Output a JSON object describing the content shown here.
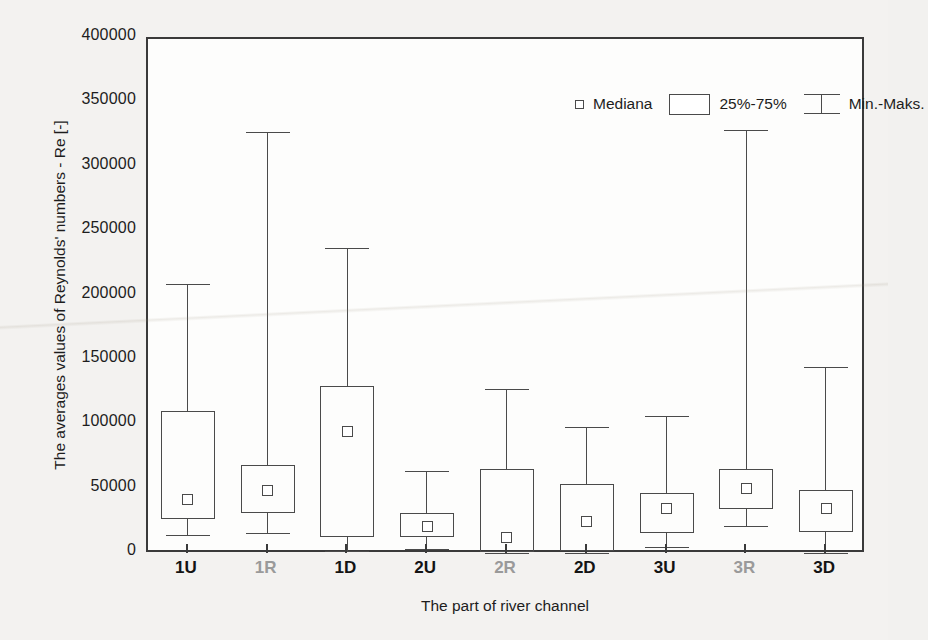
{
  "chart_data": {
    "type": "box",
    "title": "",
    "xlabel": "The part of river channel",
    "ylabel": "The averages values of Reynolds' numbers - Re [-]",
    "ylim": [
      0,
      400000
    ],
    "yticks": [
      0,
      50000,
      100000,
      150000,
      200000,
      250000,
      300000,
      350000,
      400000
    ],
    "ytick_labels": [
      "0",
      "50000",
      "100000",
      "150000",
      "200000",
      "250000",
      "300000",
      "350000",
      "400000"
    ],
    "grid": false,
    "legend_position": "top-center",
    "legend": [
      {
        "key": "median",
        "label": "Mediana",
        "symbol": "small-open-square"
      },
      {
        "key": "iqr",
        "label": "25%-75%",
        "symbol": "open-rectangle"
      },
      {
        "key": "range",
        "label": "Min.-Maks.",
        "symbol": "whisker-bar"
      }
    ],
    "categories": [
      "1U",
      "1R",
      "1D",
      "2U",
      "2R",
      "2D",
      "3U",
      "3R",
      "3D"
    ],
    "category_styles": [
      "normal",
      "dim",
      "normal",
      "normal",
      "dim",
      "normal",
      "normal",
      "dim",
      "normal"
    ],
    "boxes": [
      {
        "category": "1U",
        "min": 14500,
        "q1": 27500,
        "median": 42000,
        "q3": 111000,
        "max": 209500
      },
      {
        "category": "1R",
        "min": 16000,
        "q1": 32000,
        "median": 49000,
        "q3": 69500,
        "max": 328000
      },
      {
        "category": "1D",
        "min": 2500,
        "q1": 13500,
        "median": 95000,
        "q3": 130500,
        "max": 237500
      },
      {
        "category": "2U",
        "min": 4000,
        "q1": 13000,
        "median": 21500,
        "q3": 31500,
        "max": 64500
      },
      {
        "category": "2R",
        "min": 500,
        "q1": 1500,
        "median": 12500,
        "q3": 66000,
        "max": 128000
      },
      {
        "category": "2D",
        "min": 1000,
        "q1": 2000,
        "median": 25500,
        "q3": 54500,
        "max": 99000
      },
      {
        "category": "3U",
        "min": 5500,
        "q1": 16500,
        "median": 35500,
        "q3": 47500,
        "max": 107000
      },
      {
        "category": "3R",
        "min": 22000,
        "q1": 35000,
        "median": 50500,
        "q3": 66000,
        "max": 329000
      },
      {
        "category": "3D",
        "min": 1000,
        "q1": 17000,
        "median": 35500,
        "q3": 50000,
        "max": 145000
      }
    ]
  },
  "style": {
    "axis_color": "#3a3a3a",
    "glyph_color": "#4a4a4a",
    "plot_background": "#fdfdfc",
    "figure_background": "#f3f2f0",
    "text_color": "#1d1d1d",
    "dim_text_color": "#9a9a9a"
  }
}
